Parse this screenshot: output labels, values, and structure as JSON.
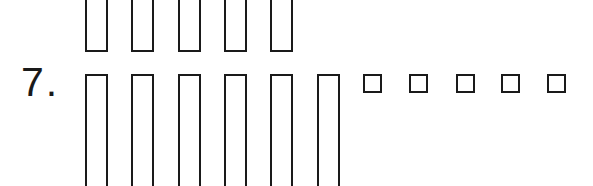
{
  "problem": {
    "number_label": "7.",
    "top_row": {
      "count": 5,
      "shape": "tall-rectangle"
    },
    "bottom_row": {
      "tall_rectangles": 6,
      "small_squares": 5
    }
  },
  "colors": {
    "stroke": "#1a1a1a",
    "background": "#ffffff"
  }
}
